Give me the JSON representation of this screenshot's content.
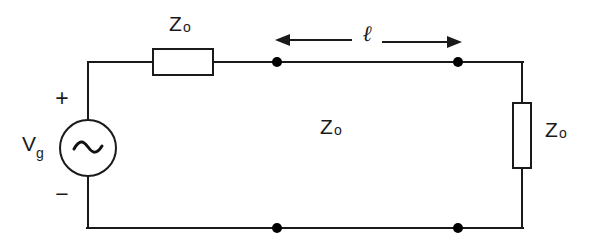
{
  "figure": {
    "name": "transmission-line-circuit",
    "background_color": "#ffffff",
    "line_color": "#1a1a1a"
  },
  "labels": {
    "source_symbol": "V",
    "source_subscript": "g",
    "source_glyph": "ac-sine",
    "plus_sign": "+",
    "minus_sign": "−",
    "series_impedance": "Z",
    "series_impedance_subscript": "o",
    "line_impedance": "Z",
    "line_impedance_subscript": "o",
    "load_impedance": "Z",
    "load_impedance_subscript": "o",
    "length_symbol": "ℓ"
  },
  "geometry": {
    "top_wire_y": 62,
    "bottom_wire_y": 228,
    "left_wire_x": 88,
    "right_wire_x": 522,
    "dimension_arrow_y": 40,
    "node_left_x": 277,
    "node_right_x": 458
  }
}
